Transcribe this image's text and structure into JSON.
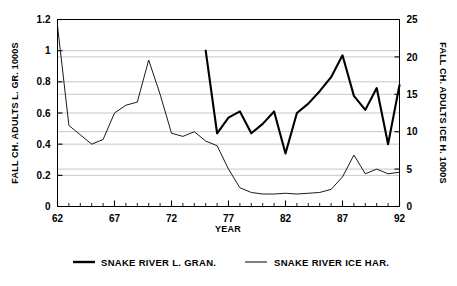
{
  "chart_data": {
    "type": "line",
    "title": "",
    "xlabel": "YEAR",
    "ylabel": "FALL CH. ADULTS L. GR. 1000S",
    "y2label": "FALL CH. ADULTS ICE H. 1000S",
    "xlim": [
      62,
      92
    ],
    "ylim": [
      0,
      1.2
    ],
    "y2lim": [
      0,
      25
    ],
    "grid": true,
    "legend_position": "bottom",
    "x_ticks": [
      62,
      67,
      72,
      77,
      82,
      87,
      92
    ],
    "x_tick_labels": [
      "62",
      "67",
      "72",
      "77",
      "82",
      "87",
      "92"
    ],
    "x_minor_tick_step": 1,
    "y_ticks": [
      0,
      0.2,
      0.4,
      0.6,
      0.8,
      1,
      1.2
    ],
    "y_tick_labels": [
      "0",
      "0.2",
      "0.4",
      "0.6",
      "0.8",
      "1",
      "1.2"
    ],
    "y2_ticks": [
      0,
      5,
      10,
      15,
      20,
      25
    ],
    "y2_tick_labels": [
      "0",
      "5",
      "10",
      "15",
      "20",
      "25"
    ],
    "series": [
      {
        "name": "SNAKE RIVER L. GRAN.",
        "axis": "left",
        "line_width": 2.1,
        "color": "#000000",
        "x": [
          75,
          76,
          77,
          78,
          79,
          80,
          81,
          82,
          83,
          84,
          85,
          86,
          87,
          88,
          89,
          90,
          91,
          92
        ],
        "values": [
          1.0,
          0.47,
          0.57,
          0.61,
          0.47,
          0.53,
          0.61,
          0.34,
          0.6,
          0.66,
          0.74,
          0.83,
          0.97,
          0.71,
          0.62,
          0.76,
          0.4,
          0.78
        ]
      },
      {
        "name": "SNAKE RIVER ICE HAR.",
        "axis": "left",
        "line_width": 0.9,
        "color": "#000000",
        "x": [
          62,
          63,
          64,
          65,
          66,
          67,
          68,
          69,
          70,
          71,
          72,
          73,
          74,
          75,
          76,
          77,
          78,
          79,
          80,
          81,
          82,
          83,
          84,
          85,
          86,
          87,
          88,
          89,
          90,
          91,
          92
        ],
        "values": [
          1.16,
          0.52,
          0.46,
          0.4,
          0.43,
          0.6,
          0.65,
          0.67,
          0.94,
          0.72,
          0.47,
          0.45,
          0.48,
          0.42,
          0.39,
          0.24,
          0.12,
          0.09,
          0.08,
          0.08,
          0.085,
          0.08,
          0.085,
          0.09,
          0.11,
          0.19,
          0.33,
          0.21,
          0.24,
          0.21,
          0.22
        ]
      }
    ]
  },
  "legend": {
    "items": [
      {
        "label": "SNAKE RIVER L. GRAN.",
        "swatch": "thick-line"
      },
      {
        "label": "SNAKE RIVER ICE HAR.",
        "swatch": "thin-line"
      }
    ]
  },
  "colors": {
    "axis": "#000000",
    "grid": "#b9b9b9",
    "background": "#ffffff"
  }
}
